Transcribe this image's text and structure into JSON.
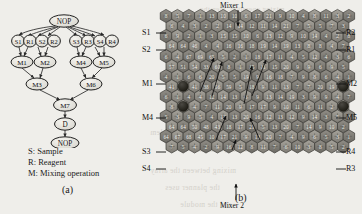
{
  "figure": {
    "panel_a": {
      "caption": "(a)",
      "legend": [
        "S: Sample",
        "R: Reagent",
        "M: Mixing operation"
      ],
      "graph": {
        "type": "sequencing-graph",
        "root_label": "NOP",
        "sink_label": "NOP",
        "dispense_label": "D",
        "sources": [
          "S1",
          "R1",
          "S2",
          "R2",
          "S3",
          "R3",
          "S4",
          "R4"
        ],
        "mix_level1": [
          "M1",
          "M2",
          "M4",
          "M5"
        ],
        "mix_level2": [
          "M3",
          "M6"
        ],
        "mix_level3": [
          "M7"
        ]
      }
    },
    "panel_b": {
      "caption": "(b)",
      "top_label": "Mixer 1",
      "bottom_label": "Mixer 2",
      "left_labels": [
        "S1",
        "S2",
        "M1",
        "M4",
        "S3",
        "S4"
      ],
      "right_labels": [
        "R2",
        "R1",
        "M2",
        "M5",
        "R4",
        "R3"
      ],
      "grid": {
        "type": "hexagonal-microelectrode-array",
        "columns": 17,
        "rows": 14,
        "cell_numbers": [
          [
            8,
            5,
            7,
            1,
            13,
            10,
            10,
            6,
            17,
            21,
            9,
            10,
            4,
            8,
            11,
            3,
            2
          ],
          [
            6,
            4,
            3,
            2,
            2,
            14,
            14,
            12,
            11,
            14,
            21,
            7,
            5,
            5,
            7,
            3,
            9
          ],
          [
            6,
            9,
            2,
            1,
            3,
            15,
            15,
            10,
            6,
            13,
            12,
            9,
            10,
            14,
            4,
            2,
            8
          ],
          [
            64,
            64,
            46,
            4,
            4,
            16,
            16,
            18,
            19,
            14,
            19,
            13,
            8,
            8,
            4,
            7,
            5
          ],
          [
            6,
            4,
            67,
            69,
            65,
            5,
            2,
            1,
            18,
            17,
            11,
            4,
            5,
            12,
            4,
            3,
            6
          ],
          [
            57,
            51,
            54,
            33,
            60,
            8,
            1,
            15,
            11,
            15,
            20,
            9,
            9,
            6,
            9,
            5,
            2
          ],
          [
            4,
            1,
            6,
            6,
            20,
            5,
            5,
            19,
            9,
            16,
            18,
            7,
            9,
            8,
            6,
            4,
            1
          ],
          [
            41,
            46,
            41,
            38,
            56,
            59,
            5,
            18,
            9,
            11,
            13,
            7,
            7,
            20,
            19,
            3,
            5
          ],
          [
            6,
            1,
            4,
            4,
            12,
            14,
            13,
            6,
            9,
            13,
            14,
            19,
            3,
            9,
            9,
            4,
            7
          ],
          [
            8,
            6,
            4,
            7,
            11,
            20,
            9,
            17,
            17,
            9,
            10,
            11,
            6,
            11,
            2,
            6,
            4
          ],
          [
            5,
            3,
            9,
            5,
            4,
            12,
            13,
            20,
            16,
            12,
            13,
            12,
            9,
            14,
            3,
            5,
            8
          ],
          [
            64,
            64,
            50,
            48,
            43,
            18,
            17,
            21,
            5,
            13,
            20,
            7,
            14,
            9,
            10,
            2,
            6
          ],
          [
            64,
            67,
            68,
            45,
            10,
            17,
            21,
            9,
            13,
            20,
            7,
            4,
            9,
            6,
            5,
            3,
            1
          ],
          [
            7,
            5,
            4,
            2,
            9,
            16,
            12,
            8,
            11,
            7,
            6,
            10,
            3,
            8,
            5,
            2,
            9
          ]
        ],
        "droplet_cells": [
          {
            "row": 7,
            "col": 1,
            "label": "M1"
          },
          {
            "row": 7,
            "col": 15,
            "label": "M2"
          },
          {
            "row": 9,
            "col": 1,
            "label": "M4"
          },
          {
            "row": 9,
            "col": 15,
            "label": "M5"
          }
        ]
      }
    }
  },
  "bleed_text": [
    "mixing operation, then the",
    "depends on the volume",
    "the system of",
    "the routing layer and the problem",
    "to the system the",
    "mixing between the array",
    "the planner uses",
    "and the module"
  ]
}
